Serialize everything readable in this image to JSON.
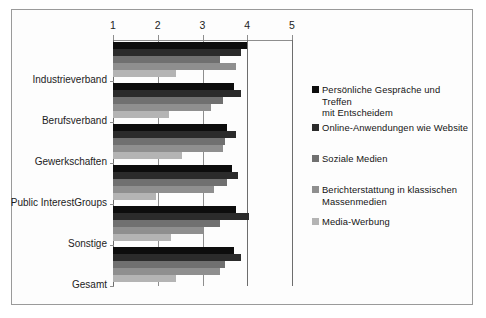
{
  "chart_data": {
    "type": "bar",
    "orientation": "horizontal",
    "title": "",
    "xlabel": "",
    "ylabel": "",
    "xlim": [
      1,
      5
    ],
    "xticks": [
      "1",
      "2",
      "3",
      "4",
      "5"
    ],
    "grid": true,
    "legend_position": "right",
    "categories": [
      "Industrieverband",
      "Berufsverband",
      "Gewerkschaften",
      "Public InterestGroups",
      "Sonstige",
      "Gesamt"
    ],
    "series": [
      {
        "name": "Persönliche Gespräche und Treffen mit Entscheidem",
        "color": "#0d0d0d",
        "values": [
          4.0,
          3.7,
          3.55,
          3.65,
          3.75,
          3.7
        ]
      },
      {
        "name": "Online-Anwendungen wie Website",
        "color": "#2b2b2b",
        "values": [
          3.85,
          3.85,
          3.75,
          3.8,
          4.05,
          3.85
        ]
      },
      {
        "name": "Soziale Medien",
        "color": "#707070",
        "values": [
          3.4,
          3.45,
          3.5,
          3.55,
          3.4,
          3.5
        ]
      },
      {
        "name": "Berichterstattung  in klassischen Massenmedien",
        "color": "#8f8f8f",
        "values": [
          3.75,
          3.2,
          3.45,
          3.25,
          3.0,
          3.4
        ]
      },
      {
        "name": "Media-Werbung",
        "color": "#b4b4b4",
        "values": [
          2.4,
          2.25,
          2.55,
          1.95,
          2.3,
          2.4
        ]
      }
    ]
  },
  "legend": {
    "items": [
      {
        "label": "Persönliche Gespräche und Treffen\nmit Entscheidem",
        "color": "#0d0d0d",
        "top": 0
      },
      {
        "label": "Online-Anwendungen wie Website",
        "color": "#2b2b2b",
        "top": 38
      },
      {
        "label": "Soziale Medien",
        "color": "#707070",
        "top": 69
      },
      {
        "label": "Berichterstattung  in klassischen\nMassenmedien",
        "color": "#8f8f8f",
        "top": 100
      },
      {
        "label": "Media-Werbung",
        "color": "#b4b4b4",
        "top": 132
      }
    ]
  },
  "axis": {
    "ticks": [
      {
        "label": "1",
        "value": 1
      },
      {
        "label": "2",
        "value": 2
      },
      {
        "label": "3",
        "value": 3
      },
      {
        "label": "4",
        "value": 4
      },
      {
        "label": "5",
        "value": 5
      }
    ]
  }
}
